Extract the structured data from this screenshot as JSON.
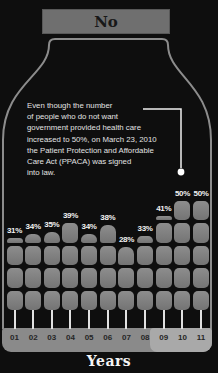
{
  "header": {
    "label": "No"
  },
  "callout": {
    "text": "Even though the number\nof people who do not want\ngovernment provided health care\nincreased to 50%, on March 23, 2010\nthe Patient Protection and Affordable\nCare Act (PPACA) was signed\ninto law."
  },
  "chart_data": {
    "type": "bar",
    "title": "",
    "categories": [
      "01",
      "02",
      "03",
      "04",
      "05",
      "06",
      "07",
      "08",
      "09",
      "10",
      "11"
    ],
    "values": [
      31,
      34,
      35,
      39,
      34,
      38,
      28,
      33,
      41,
      50,
      50
    ],
    "value_labels": [
      "31%",
      "34%",
      "35%",
      "39%",
      "34%",
      "38%",
      "28%",
      "33%",
      "41%",
      "50%",
      "50%"
    ],
    "xlabel": "Years",
    "ylabel": "",
    "ylim": [
      0,
      50
    ],
    "grid": false,
    "legend": "none",
    "highlight_categories": [
      "09",
      "10",
      "11"
    ],
    "annotation_target_category": "10"
  },
  "colors": {
    "background": "#0e0e0e",
    "header_box": "#6f6f6f",
    "jar_outline": "#8c8c8c",
    "bar_fill": "#7e7e7e",
    "band": "#8a8a8a",
    "band_highlight": "#a9a9a9",
    "callout_line": "#f0f0f0",
    "text_light": "#e3e3e3",
    "text_dark": "#262626"
  }
}
